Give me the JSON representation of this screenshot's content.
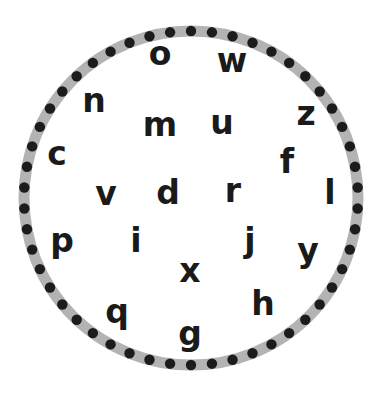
{
  "worksheet": {
    "circle": {
      "center": [
        191,
        198
      ],
      "radius": 167,
      "band_width": 11,
      "band_color": "#b3b3b3",
      "dot_color": "#1c1c1c",
      "dot_radius": 5.2,
      "dot_count": 50
    },
    "letters": [
      {
        "char": "o",
        "x": 160,
        "y": 53,
        "size": 33
      },
      {
        "char": "w",
        "x": 232,
        "y": 60,
        "size": 33
      },
      {
        "char": "n",
        "x": 94,
        "y": 100,
        "size": 33
      },
      {
        "char": "m",
        "x": 160,
        "y": 124,
        "size": 33
      },
      {
        "char": "u",
        "x": 222,
        "y": 122,
        "size": 33
      },
      {
        "char": "z",
        "x": 306,
        "y": 113,
        "size": 33
      },
      {
        "char": "c",
        "x": 57,
        "y": 153,
        "size": 33
      },
      {
        "char": "f",
        "x": 287,
        "y": 161,
        "size": 33
      },
      {
        "char": "v",
        "x": 106,
        "y": 193,
        "size": 33
      },
      {
        "char": "d",
        "x": 168,
        "y": 192,
        "size": 33
      },
      {
        "char": "r",
        "x": 233,
        "y": 190,
        "size": 33
      },
      {
        "char": "l",
        "x": 330,
        "y": 192,
        "size": 33
      },
      {
        "char": "p",
        "x": 62,
        "y": 240,
        "size": 33
      },
      {
        "char": "i",
        "x": 136,
        "y": 240,
        "size": 33
      },
      {
        "char": "j",
        "x": 250,
        "y": 240,
        "size": 33
      },
      {
        "char": "y",
        "x": 308,
        "y": 250,
        "size": 33
      },
      {
        "char": "x",
        "x": 190,
        "y": 270,
        "size": 33
      },
      {
        "char": "q",
        "x": 117,
        "y": 311,
        "size": 33
      },
      {
        "char": "h",
        "x": 263,
        "y": 303,
        "size": 33
      },
      {
        "char": "g",
        "x": 190,
        "y": 333,
        "size": 33
      }
    ]
  }
}
